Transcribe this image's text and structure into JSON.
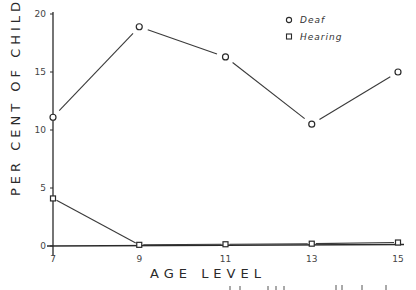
{
  "chart_data": {
    "type": "line",
    "title": "",
    "xlabel": "AGE LEVEL",
    "ylabel": "PER CENT OF CHILDREN",
    "x": [
      7,
      9,
      11,
      13,
      15
    ],
    "x_tick_labels": [
      "7",
      "9",
      "11",
      "13",
      "15"
    ],
    "y_tick_labels": [
      "0",
      "5",
      "10",
      "15",
      "20"
    ],
    "y_ticks": [
      0,
      5,
      10,
      15,
      20
    ],
    "ylim": [
      0,
      20
    ],
    "xlim": [
      7,
      15
    ],
    "grid": false,
    "legend_position": "upper right",
    "series": [
      {
        "name": "Deaf",
        "marker": "circle",
        "values": [
          11.1,
          18.9,
          16.3,
          10.5,
          15.0
        ]
      },
      {
        "name": "Hearing",
        "marker": "square",
        "values": [
          4.1,
          0.1,
          0.15,
          0.2,
          0.3
        ]
      }
    ]
  },
  "legend": {
    "items": [
      {
        "label": "Deaf",
        "marker": "circle"
      },
      {
        "label": "Hearing",
        "marker": "square"
      }
    ]
  },
  "colors": {
    "ink": "#2a2a2a",
    "background": "#ffffff"
  }
}
